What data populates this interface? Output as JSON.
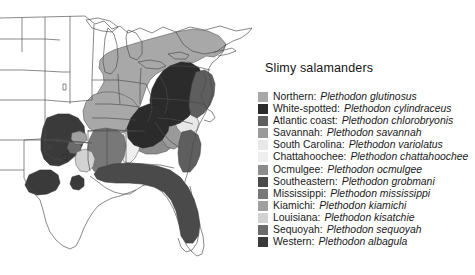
{
  "figure": {
    "background": "#ffffff",
    "width": 475,
    "height": 275
  },
  "legend": {
    "title": "Slimy salamanders",
    "separator": ":",
    "items": [
      {
        "common": "Northern:",
        "scientific": "Plethodon glutinosus",
        "color": "#a8a8a8"
      },
      {
        "common": "White-spotted:",
        "scientific": "Plethodon cylindraceus",
        "color": "#2b2b2b"
      },
      {
        "common": "Atlantic coast:",
        "scientific": "Plethodon chlorobryonis",
        "color": "#5e5e5e"
      },
      {
        "common": "Savannah:",
        "scientific": "Plethodon savannah",
        "color": "#9a9a9a"
      },
      {
        "common": "South Carolina:",
        "scientific": "Plethodon variolatus",
        "color": "#e8e8e8"
      },
      {
        "common": "Chattahoochee:",
        "scientific": "Plethodon chattahoochee",
        "color": "#efefef"
      },
      {
        "common": "Ocmulgee:",
        "scientific": "Plethodon ocmulgee",
        "color": "#8c8c8c"
      },
      {
        "common": "Southeastern:",
        "scientific": "Plethodon grobmani",
        "color": "#4a4a4a"
      },
      {
        "common": "Mississippi:",
        "scientific": "Plethodon mississippi",
        "color": "#787878"
      },
      {
        "common": "Kiamichi:",
        "scientific": "Plethodon kiamichi",
        "color": "#a0a0a0"
      },
      {
        "common": "Louisiana:",
        "scientific": "Plethodon kisatchie",
        "color": "#d2d2d2"
      },
      {
        "common": "Sequoyah:",
        "scientific": "Plethodon sequoyah",
        "color": "#6b6b6b"
      },
      {
        "common": "Western:",
        "scientific": "Plethodon albagula",
        "color": "#3a3a3a"
      }
    ]
  },
  "map": {
    "label": "Distribution map of the eastern United States",
    "outline_color": "#444444",
    "unshaded_color": "#ffffff",
    "regions": [
      {
        "name": "northern-appalachian",
        "color": "#a8a8a8"
      },
      {
        "name": "white-spotted-piedmont",
        "color": "#2b2b2b"
      },
      {
        "name": "atlantic-coastal-plain",
        "color": "#5e5e5e"
      },
      {
        "name": "savannah-valley",
        "color": "#9a9a9a"
      },
      {
        "name": "south-carolina-coast",
        "color": "#e8e8e8"
      },
      {
        "name": "chattahoochee-basin",
        "color": "#efefef"
      },
      {
        "name": "ocmulgee-basin",
        "color": "#8c8c8c"
      },
      {
        "name": "southeastern-gulf",
        "color": "#4a4a4a"
      },
      {
        "name": "mississippi-valley",
        "color": "#787878"
      },
      {
        "name": "kiamichi-ouachita",
        "color": "#a0a0a0"
      },
      {
        "name": "louisiana-kisatchie",
        "color": "#d2d2d2"
      },
      {
        "name": "sequoyah-oklahoma",
        "color": "#6b6b6b"
      },
      {
        "name": "western-ozark-edwards",
        "color": "#3a3a3a"
      }
    ]
  }
}
